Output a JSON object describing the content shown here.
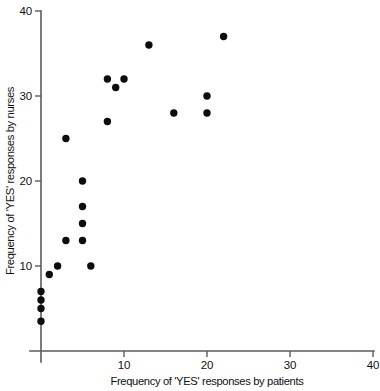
{
  "chart_data": {
    "type": "scatter",
    "title": "",
    "xlabel": "Frequency of 'YES' responses by patients",
    "ylabel": "Frequency of 'YES' responses by nurses",
    "xlim": [
      0,
      40
    ],
    "ylim": [
      0,
      40
    ],
    "xticks": [
      10,
      20,
      30,
      40
    ],
    "yticks": [
      10,
      20,
      30,
      40
    ],
    "xtick_labels": [
      "10",
      "20",
      "30",
      "40"
    ],
    "ytick_labels": [
      "10",
      "20",
      "30",
      "40"
    ],
    "grid": false,
    "legend": null,
    "marker": "filled-circle",
    "marker_color": "#0d0d0d",
    "axis_color": "#5b5b60",
    "background_color": "#ffffff",
    "n_points": 20,
    "points": [
      {
        "x": 0,
        "y": 3.5
      },
      {
        "x": 0,
        "y": 5
      },
      {
        "x": 0,
        "y": 6
      },
      {
        "x": 0,
        "y": 7
      },
      {
        "x": 1,
        "y": 9
      },
      {
        "x": 2,
        "y": 10
      },
      {
        "x": 6,
        "y": 10
      },
      {
        "x": 3,
        "y": 13
      },
      {
        "x": 5,
        "y": 13
      },
      {
        "x": 5,
        "y": 15
      },
      {
        "x": 5,
        "y": 17
      },
      {
        "x": 5,
        "y": 20
      },
      {
        "x": 3,
        "y": 25
      },
      {
        "x": 8,
        "y": 27
      },
      {
        "x": 16,
        "y": 28
      },
      {
        "x": 20,
        "y": 28
      },
      {
        "x": 20,
        "y": 30
      },
      {
        "x": 9,
        "y": 31
      },
      {
        "x": 8,
        "y": 32
      },
      {
        "x": 10,
        "y": 32
      },
      {
        "x": 13,
        "y": 36
      },
      {
        "x": 22,
        "y": 37
      }
    ]
  },
  "axes": {
    "x_axis_name": "x-axis",
    "y_axis_name": "y-axis"
  }
}
